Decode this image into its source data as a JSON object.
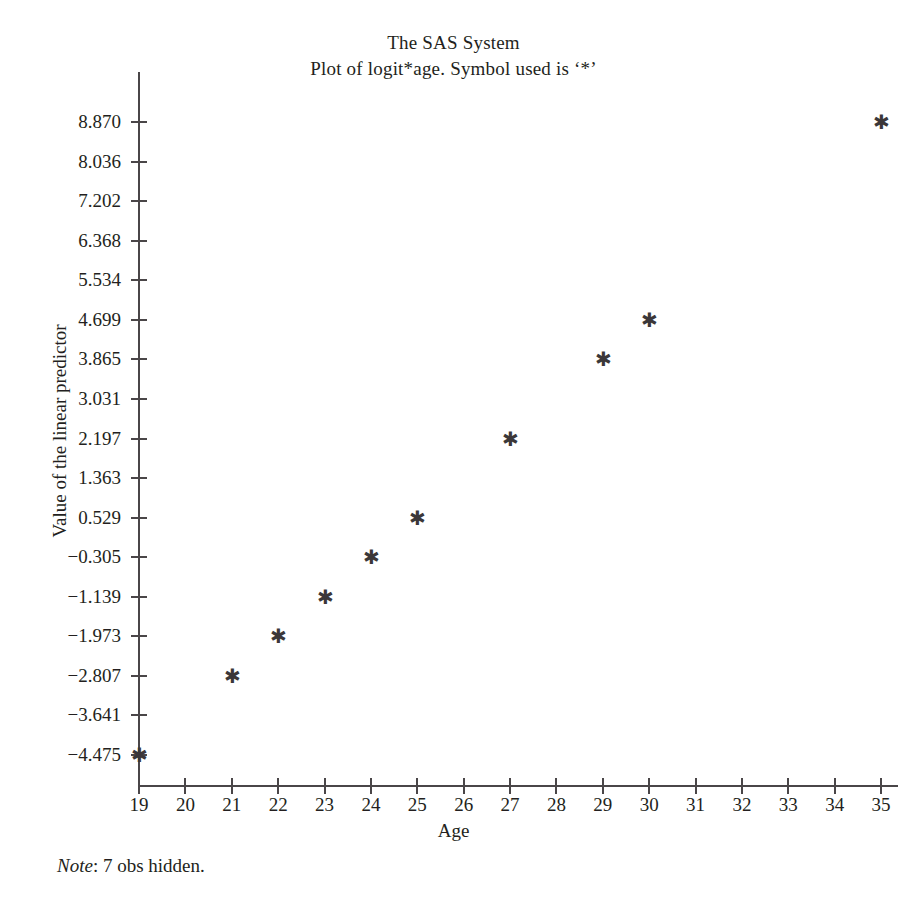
{
  "title": {
    "line1": "The SAS System",
    "line2": "Plot of logit*age. Symbol used is ‘*’"
  },
  "footnote": {
    "label": "Note",
    "text": ": 7 obs hidden."
  },
  "colors": {
    "axis": "#4a4648",
    "text": "#231f20",
    "marker": "#3b3739",
    "background": "#ffffff"
  },
  "marker_glyph": "✱",
  "chart_data": {
    "type": "scatter",
    "title": "The SAS System",
    "subtitle": "Plot of logit*age. Symbol used is ‘*’",
    "xlabel": "Age",
    "ylabel": "Value of the linear predictor",
    "xlim": [
      19,
      35
    ],
    "ylim": [
      -4.475,
      8.87
    ],
    "grid": false,
    "legend": null,
    "xticks": [
      19,
      20,
      21,
      22,
      23,
      24,
      25,
      26,
      27,
      28,
      29,
      30,
      31,
      32,
      33,
      34,
      35
    ],
    "xtick_labels": [
      "19",
      "20",
      "21",
      "22",
      "23",
      "24",
      "25",
      "26",
      "27",
      "28",
      "29",
      "30",
      "31",
      "32",
      "33",
      "34",
      "35"
    ],
    "yticks": [
      8.87,
      8.036,
      7.202,
      6.368,
      5.534,
      4.699,
      3.865,
      3.031,
      2.197,
      1.363,
      0.529,
      -0.305,
      -1.139,
      -1.973,
      -2.807,
      -3.641,
      -4.475
    ],
    "ytick_labels": [
      "8.870",
      "8.036",
      "7.202",
      "6.368",
      "5.534",
      "4.699",
      "3.865",
      "3.031",
      "2.197",
      "1.363",
      "0.529",
      "−0.305",
      "−1.139",
      "−1.973",
      "−2.807",
      "−3.641",
      "−4.475"
    ],
    "series": [
      {
        "name": "logit",
        "symbol": "*",
        "points": [
          {
            "x": 19,
            "y": -4.475
          },
          {
            "x": 21,
            "y": -2.807
          },
          {
            "x": 22,
            "y": -1.973
          },
          {
            "x": 23,
            "y": -1.139
          },
          {
            "x": 24,
            "y": -0.305
          },
          {
            "x": 25,
            "y": 0.529
          },
          {
            "x": 27,
            "y": 2.197
          },
          {
            "x": 29,
            "y": 3.865
          },
          {
            "x": 30,
            "y": 4.699
          },
          {
            "x": 35,
            "y": 8.87
          }
        ]
      }
    ],
    "annotations": [
      "Note: 7 obs hidden."
    ]
  }
}
